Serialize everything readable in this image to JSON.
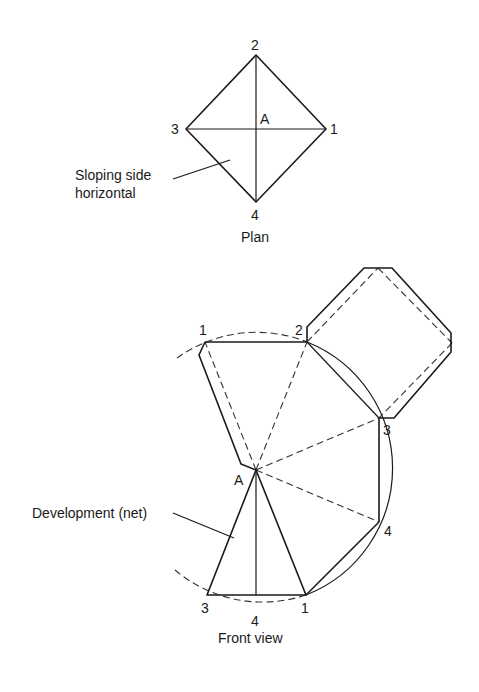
{
  "plan": {
    "caption": "Plan",
    "vertex_labels": {
      "v1": "1",
      "v2": "2",
      "v3": "3",
      "v4": "4",
      "apex": "A"
    },
    "callout": {
      "line1": "Sloping side",
      "line2": "horizontal"
    }
  },
  "front": {
    "caption": "Front view",
    "apex_label": "A",
    "net_labels": {
      "top_1": "1",
      "top_2": "2",
      "right_3": "3",
      "right_4": "4",
      "bottom_3": "3",
      "bottom_4": "4",
      "bottom_1": "1"
    },
    "callout": "Development (net)"
  },
  "colors": {
    "line": "#1a1a1a",
    "background": "#ffffff"
  }
}
